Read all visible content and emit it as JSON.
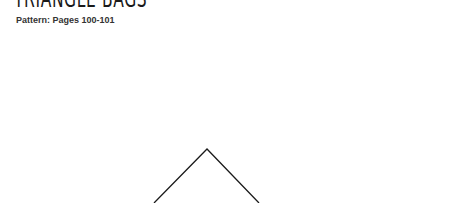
{
  "header": {
    "title": "TRIANGLE BAGS",
    "subtitle": "Pattern: Pages 100-101"
  },
  "pattern": {
    "shape": "triangle-outline",
    "stroke_color": "#1a1a1a",
    "apex": [
      207,
      149
    ],
    "left_base": [
      154,
      203
    ],
    "right_base": [
      259,
      203
    ]
  }
}
